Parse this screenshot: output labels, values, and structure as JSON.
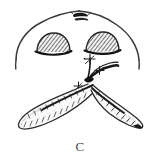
{
  "figure": {
    "caption": "C",
    "background_color": "#ffffff",
    "ink_color": "#2b2b2b",
    "shade_color": "#8a8a8a",
    "parts": {
      "nose_outline": "nasal-base-outline",
      "apex_mark": "apex-dark-wedge",
      "left_nostril": "left-nostril-hatched",
      "right_nostril": "right-nostril-hatched",
      "columella_stem": "central-columella-stem",
      "left_flap": "left-elevated-flap",
      "right_flap": "right-elevated-flap",
      "sutures": "suture-cross-marks"
    },
    "annotations": [
      {
        "name": "suture-upper",
        "x": 92,
        "y": 62
      },
      {
        "name": "suture-middle",
        "x": 98,
        "y": 70
      },
      {
        "name": "suture-lower-left",
        "x": 79,
        "y": 86
      }
    ]
  }
}
